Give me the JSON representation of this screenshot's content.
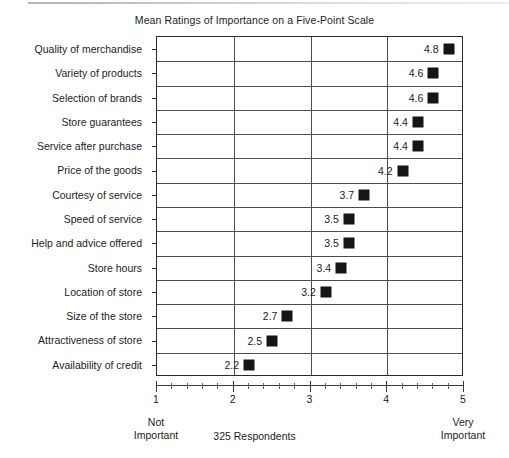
{
  "chart_data": {
    "type": "scatter",
    "title": "Mean Ratings of Importance on a Five-Point Scale",
    "xlabel": "325 Respondents",
    "ylabel": "",
    "xlim": [
      1,
      5
    ],
    "xticks": [
      1,
      2,
      3,
      4,
      5
    ],
    "xtick_labels": [
      "1",
      "2",
      "3",
      "4",
      "5"
    ],
    "minor_tick_step": 0.2,
    "grid": true,
    "legend": "none",
    "scale_anchor_low": "Not\nImportant",
    "scale_anchor_low_line1": "Not",
    "scale_anchor_low_line2": "Important",
    "scale_anchor_high_line1": "Very",
    "scale_anchor_high_line2": "Important",
    "footnote": "325 Respondents",
    "marker_color": "#151515",
    "axis_color": "#2b2b2b",
    "categories": [
      "Quality of merchandise",
      "Variety of products",
      "Selection of brands",
      "Store guarantees",
      "Service after purchase",
      "Price of the goods",
      "Courtesy of service",
      "Speed of service",
      "Help and advice offered",
      "Store hours",
      "Location of store",
      "Size of the store",
      "Attractiveness of store",
      "Availability of credit"
    ],
    "values": [
      4.8,
      4.6,
      4.6,
      4.4,
      4.4,
      4.2,
      3.7,
      3.5,
      3.5,
      3.4,
      3.2,
      2.7,
      2.5,
      2.2
    ],
    "value_labels": [
      "4.8",
      "4.6",
      "4.6",
      "4.4",
      "4.4",
      "4.2",
      "3.7",
      "3.5",
      "3.5",
      "3.4",
      "3.2",
      "2.7",
      "2.5",
      "2.2"
    ]
  }
}
